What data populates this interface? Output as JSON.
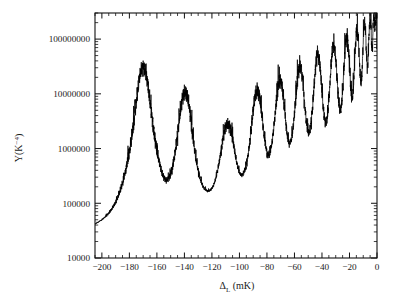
{
  "chart_data": {
    "type": "line",
    "title": "",
    "xlabel": "ΔL (mK)",
    "xlabel_main": "Δ",
    "xlabel_sub": "L",
    "xlabel_unit": "(mK)",
    "ylabel": "Y(K−4)",
    "ylabel_main": "Y(K",
    "ylabel_sup": "−4",
    "ylabel_close": ")",
    "xscale": "linear",
    "yscale": "log",
    "xlim": [
      -205,
      0
    ],
    "ylim": [
      10000,
      300000000
    ],
    "grid": false,
    "legend": null,
    "xticks": [
      -200,
      -180,
      -160,
      -140,
      -120,
      -100,
      -80,
      -60,
      -40,
      -20,
      0
    ],
    "xticklabels": [
      "−200",
      "−180",
      "−160",
      "−140",
      "−120",
      "−100",
      "−80",
      "−60",
      "−40",
      "−20",
      "0"
    ],
    "yticks": [
      10000,
      100000,
      1000000,
      10000000,
      100000000
    ],
    "yticklabels": [
      "10000",
      "100000",
      "1000000",
      "10000000",
      "100000000"
    ],
    "series": [
      {
        "name": "Y",
        "color": "#000000",
        "resonances": [
          {
            "center": -170.0,
            "amplitude": 30000000,
            "width": 4.2
          },
          {
            "center": -139.5,
            "amplitude": 10500000,
            "width": 4.0
          },
          {
            "center": -108.5,
            "amplitude": 2600000,
            "width": 4.6
          },
          {
            "center": -87.0,
            "amplitude": 11000000,
            "width": 3.4
          },
          {
            "center": -70.5,
            "amplitude": 17000000,
            "width": 3.0
          },
          {
            "center": -56.0,
            "amplitude": 30000000,
            "width": 2.7
          },
          {
            "center": -43.0,
            "amplitude": 50000000,
            "width": 2.4
          },
          {
            "center": -31.5,
            "amplitude": 75000000,
            "width": 2.1
          },
          {
            "center": -22.0,
            "amplitude": 105000000,
            "width": 1.8
          },
          {
            "center": -14.5,
            "amplitude": 145000000,
            "width": 1.5
          },
          {
            "center": -9.0,
            "amplitude": 185000000,
            "width": 1.2
          },
          {
            "center": -5.0,
            "amplitude": 225000000,
            "width": 1.0
          },
          {
            "center": -2.3,
            "amplitude": 255000000,
            "width": 0.8
          },
          {
            "center": -0.7,
            "amplitude": 270000000,
            "width": 0.6
          }
        ],
        "baseline_left": 200000,
        "baseline_min": 35000,
        "noise_amplitude": 0.55,
        "notes": "Logarithmically periodic resonance peaks with fine quasi-random structure on the upper flanks; envelope rises toward ΔL = 0."
      }
    ]
  },
  "figure": {
    "background_color": "#ffffff",
    "axis_color": "#111111",
    "curve_color": "#000000",
    "plot_box": {
      "left": 95,
      "right": 377,
      "top": 13,
      "bottom": 258
    }
  }
}
